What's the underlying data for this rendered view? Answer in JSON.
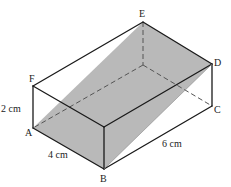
{
  "figure": {
    "type": "cuboid-with-shaded-plane",
    "vertices": {
      "A": "A",
      "B": "B",
      "C": "C",
      "D": "D",
      "E": "E",
      "F": "F"
    },
    "dimensions": {
      "height": "2 cm",
      "width": "4 cm",
      "length": "6 cm"
    },
    "shaded_plane": [
      "A",
      "B",
      "D",
      "E"
    ],
    "colors": {
      "shade": "#b9b9b9",
      "edge": "#1a1a1a",
      "hidden_edge": "#555555"
    }
  }
}
